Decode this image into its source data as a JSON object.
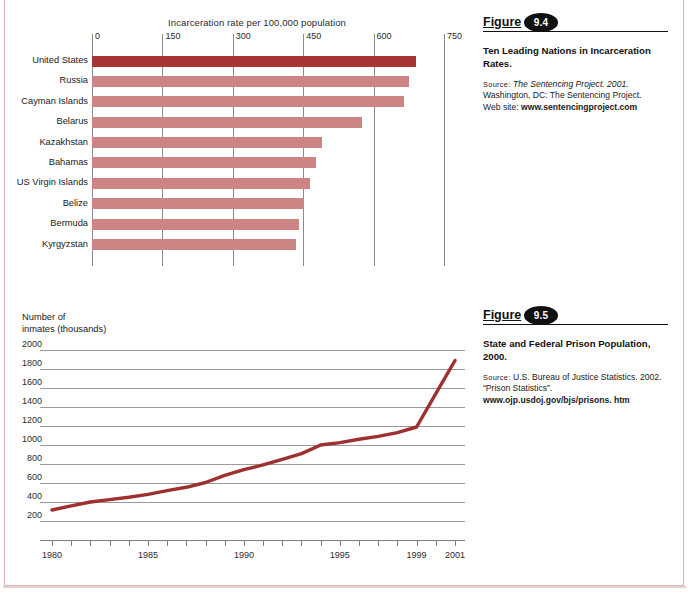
{
  "chart_data": [
    {
      "type": "bar",
      "orientation": "horizontal",
      "title": "Ten Leading Nations in Incarceration Rates.",
      "axis_title": "Incarceration rate per 100,000 population",
      "xlabel": "Incarceration rate per 100,000 population",
      "ylabel": "",
      "xlim": [
        0,
        750
      ],
      "xticks": [
        0,
        150,
        300,
        450,
        600,
        750
      ],
      "xtick_labels": [
        "0",
        "150",
        "300",
        "450",
        "600",
        "750"
      ],
      "grid": true,
      "legend": "none",
      "highlight_index": 0,
      "bar_color": "#cc8484",
      "highlight_color": "#a83333",
      "categories": [
        "United States",
        "Russia",
        "Cayman Islands",
        "Belarus",
        "Kazakhstan",
        "Bahamas",
        "US Virgin Islands",
        "Belize",
        "Bermuda",
        "Kyrgyzstan"
      ],
      "values": [
        690,
        675,
        664,
        575,
        490,
        478,
        465,
        452,
        440,
        435
      ]
    },
    {
      "type": "line",
      "title": "State and Federal Prison Population, 2000.",
      "ylabel": "Number of\ninmates (thousands)",
      "ylabel_lines": [
        "Number of",
        "inmates (thousands)"
      ],
      "xlabel": "",
      "ylim": [
        0,
        2000
      ],
      "yticks": [
        200,
        400,
        600,
        800,
        1000,
        1200,
        1400,
        1600,
        1800,
        2000
      ],
      "ytick_labels": [
        "200",
        "400",
        "600",
        "800",
        "1000",
        "1200",
        "1400",
        "1600",
        "1800",
        "2000"
      ],
      "xlim": [
        1980,
        2001
      ],
      "xticks": [
        1980,
        1985,
        1990,
        1995,
        1999,
        2001
      ],
      "xtick_labels": [
        "1980",
        "1985",
        "1990",
        "1995",
        "1999",
        "2001"
      ],
      "grid": true,
      "legend": "none",
      "line_color": "#9e3030",
      "x": [
        1980,
        1981,
        1982,
        1983,
        1984,
        1985,
        1986,
        1987,
        1988,
        1989,
        1990,
        1991,
        1992,
        1993,
        1994,
        1995,
        1996,
        1997,
        1998,
        1999,
        2000,
        2001
      ],
      "values": [
        316,
        360,
        400,
        425,
        450,
        480,
        520,
        555,
        605,
        680,
        740,
        790,
        850,
        910,
        1000,
        1025,
        1060,
        1090,
        1130,
        1190,
        1540,
        1890
      ]
    }
  ],
  "bar_chart": {
    "axis_title": "Incarceration rate per 100,000 population",
    "ticks": [
      "0",
      "150",
      "300",
      "450",
      "600",
      "750"
    ],
    "rows": [
      {
        "label": "United States",
        "value": 690
      },
      {
        "label": "Russia",
        "value": 675
      },
      {
        "label": "Cayman Islands",
        "value": 664
      },
      {
        "label": "Belarus",
        "value": 575
      },
      {
        "label": "Kazakhstan",
        "value": 490
      },
      {
        "label": "Bahamas",
        "value": 478
      },
      {
        "label": "US Virgin Islands",
        "value": 465
      },
      {
        "label": "Belize",
        "value": 452
      },
      {
        "label": "Bermuda",
        "value": 440
      },
      {
        "label": "Kyrgyzstan",
        "value": 435
      }
    ]
  },
  "line_chart": {
    "ylabel_line1": "Number of",
    "ylabel_line2": "inmates (thousands)",
    "yticks": [
      "2000",
      "1800",
      "1600",
      "1400",
      "1200",
      "1000",
      "800",
      "600",
      "400",
      "200"
    ],
    "xticks": [
      "1980",
      "1985",
      "1990",
      "1995",
      "1999",
      "2001"
    ]
  },
  "figures": [
    {
      "word": "Figure",
      "number": "9.4",
      "title": "Ten Leading Nations in Incarceration Rates.",
      "source_label": "Source:",
      "source_italic": "The Sentencing Project. 2001.",
      "source_line2": "Washington, DC: The Sentencing Project.",
      "source_line3_label": "Web site:",
      "source_line3_bold": "www.sentencingproject.com"
    },
    {
      "word": "Figure",
      "number": "9.5",
      "title": "State and Federal Prison Population, 2000.",
      "source_label": "Source:",
      "source_line1": "U.S. Bureau of Justice Statistics. 2002.",
      "source_line2": "“Prison Statistics”.",
      "source_line3_bold": "www.ojp.usdoj.gov/bjs/prisons. htm"
    }
  ]
}
